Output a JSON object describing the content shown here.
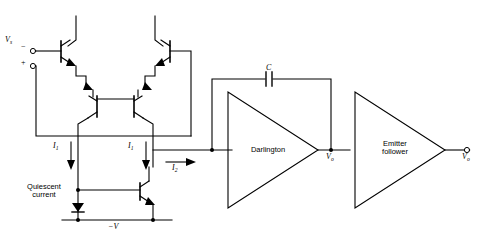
{
  "figure": {
    "type": "circuit-schematic",
    "background_color": "#ffffff",
    "line_color": "#000000"
  },
  "labels": {
    "input_source": "V",
    "input_source_sub": "s",
    "input_minus": "−",
    "input_plus": "+",
    "current_i1_left": "I",
    "current_i1_left_sub": "1",
    "current_i1_right": "I",
    "current_i1_right_sub": "1",
    "current_i2": "I",
    "current_i2_sub": "2",
    "quiescent_line1": "Quiescent",
    "quiescent_line2": "current",
    "negative_supply": "−V",
    "capacitor": "C",
    "darlington": "Darlington",
    "emitter_follower_line1": "Emitter",
    "emitter_follower_line2": "follower",
    "v_o_intermediate": "V",
    "v_o_intermediate_sub": "o",
    "v_o_output": "V",
    "v_o_output_sub": "o"
  },
  "blocks": [
    {
      "name": "darlington",
      "label": "Darlington",
      "shape": "triangle-right"
    },
    {
      "name": "emitter-follower",
      "label": "Emitter follower",
      "shape": "triangle-right"
    }
  ],
  "components": {
    "transistors": 5,
    "diodes": 1,
    "capacitors": 1,
    "input_terminals": 2,
    "output_terminals": 1
  }
}
